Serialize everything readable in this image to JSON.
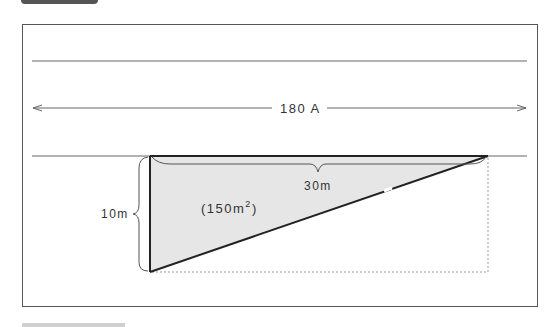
{
  "diagram": {
    "road_width_label": "180 A",
    "height_label": "10m",
    "length_label": "30m",
    "area_label_prefix": "(150m",
    "area_label_sup": "2",
    "area_label_suffix": ")",
    "colors": {
      "frame": "#555555",
      "lines": "#666666",
      "triangle_fill": "#e6e6e6",
      "triangle_edge": "#222222",
      "dotted": "#999999",
      "text": "#333333"
    }
  }
}
